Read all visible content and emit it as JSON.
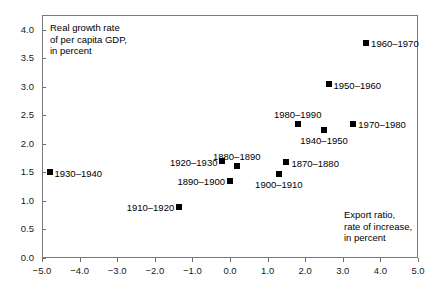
{
  "chart_data": {
    "type": "scatter",
    "title": "",
    "xlabel": "Export ratio, rate of increase, in percent",
    "ylabel": "Real growth rate of per capita GDP, in percent",
    "xlim": [
      -5.0,
      5.0
    ],
    "ylim": [
      0.0,
      4.26
    ],
    "grid": false,
    "legend": "none",
    "xticks": [
      "-5.0",
      "-4.0",
      "-3.0",
      "-2.0",
      "-1.0",
      "0.0",
      "1.0",
      "2.0",
      "3.0",
      "4.0",
      "5.0"
    ],
    "xtick_values": [
      -5.0,
      -4.0,
      -3.0,
      -2.0,
      -1.0,
      0.0,
      1.0,
      2.0,
      3.0,
      4.0,
      5.0
    ],
    "yticks": [
      "0.0",
      "0.5",
      "1.0",
      "1.5",
      "2.0",
      "2.5",
      "3.0",
      "3.5",
      "4.0"
    ],
    "ytick_values": [
      0.0,
      0.5,
      1.0,
      1.5,
      2.0,
      2.5,
      3.0,
      3.5,
      4.0
    ],
    "points": [
      {
        "label": "1930–1940",
        "x": -4.8,
        "y": 1.5,
        "label_pos": "right"
      },
      {
        "label": "1910–1920",
        "x": -1.35,
        "y": 0.9,
        "label_pos": "left"
      },
      {
        "label": "1920–1930",
        "x": -0.2,
        "y": 1.7,
        "label_pos": "left"
      },
      {
        "label": "1890–1900",
        "x": 0.0,
        "y": 1.35,
        "label_pos": "left"
      },
      {
        "label": "1880–1890",
        "x": 0.18,
        "y": 1.62,
        "label_pos": "above"
      },
      {
        "label": "1900–1910",
        "x": 1.3,
        "y": 1.48,
        "label_pos": "below"
      },
      {
        "label": "1870–1880",
        "x": 1.5,
        "y": 1.68,
        "label_pos": "right"
      },
      {
        "label": "1980–1990",
        "x": 1.8,
        "y": 2.35,
        "label_pos": "above"
      },
      {
        "label": "1940–1950",
        "x": 2.5,
        "y": 2.25,
        "label_pos": "below"
      },
      {
        "label": "1950–1960",
        "x": 2.62,
        "y": 3.05,
        "label_pos": "right"
      },
      {
        "label": "1970–1980",
        "x": 3.28,
        "y": 2.35,
        "label_pos": "right"
      },
      {
        "label": "1960–1970",
        "x": 3.62,
        "y": 3.77,
        "label_pos": "right"
      }
    ],
    "annotations": [
      {
        "name": "y-axis-note",
        "text": "Real growth rate\nof per capita GDP,\nin percent",
        "x_px": 50,
        "y_px": 22
      },
      {
        "name": "x-axis-note",
        "text": "Export ratio,\nrate of increase,\nin percent",
        "x_px": 344,
        "y_px": 209
      }
    ]
  }
}
